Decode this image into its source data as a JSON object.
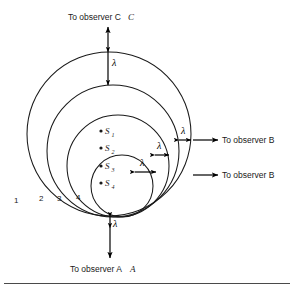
{
  "figure": {
    "title_top": "To observer C",
    "label_right_upper": "To observer B",
    "label_right_lower": "To observer B",
    "label_bottom": "To observer A",
    "wavelength_symbol": "λ",
    "ring_labels": [
      "1",
      "2",
      "3",
      "4"
    ],
    "sources": [
      {
        "base": "S",
        "sub": "1"
      },
      {
        "base": "S",
        "sub": "2"
      },
      {
        "base": "S",
        "sub": "3"
      },
      {
        "base": "S",
        "sub": "4"
      }
    ],
    "lambda_markers": [
      {
        "name": "lambda-top",
        "symbol": "λ"
      },
      {
        "name": "lambda-right-outer",
        "symbol": "λ"
      },
      {
        "name": "lambda-right-middle",
        "symbol": "λ"
      },
      {
        "name": "lambda-right-inner",
        "symbol": "λ"
      },
      {
        "name": "lambda-bottom",
        "symbol": "λ"
      }
    ],
    "colors": {
      "stroke": "#1a1a1a",
      "text": "#1a1a1a",
      "background": "#ffffff",
      "rule": "#4a4a4a"
    }
  }
}
